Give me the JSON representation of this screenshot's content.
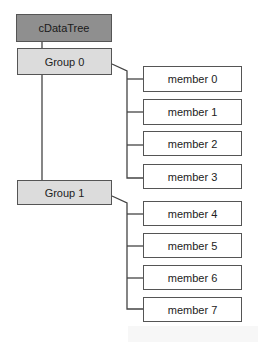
{
  "diagram": {
    "type": "tree",
    "root": {
      "label": "cDataTree"
    },
    "groups": [
      {
        "label": "Group 0",
        "members": [
          "member 0",
          "member 1",
          "member 2",
          "member 3"
        ]
      },
      {
        "label": "Group 1",
        "members": [
          "member 4",
          "member 5",
          "member 6",
          "member 7"
        ]
      }
    ],
    "colors": {
      "root_fill": "#8f8f8f",
      "group_fill": "#dcdcdc",
      "member_fill": "#ffffff",
      "line": "#444444"
    }
  }
}
